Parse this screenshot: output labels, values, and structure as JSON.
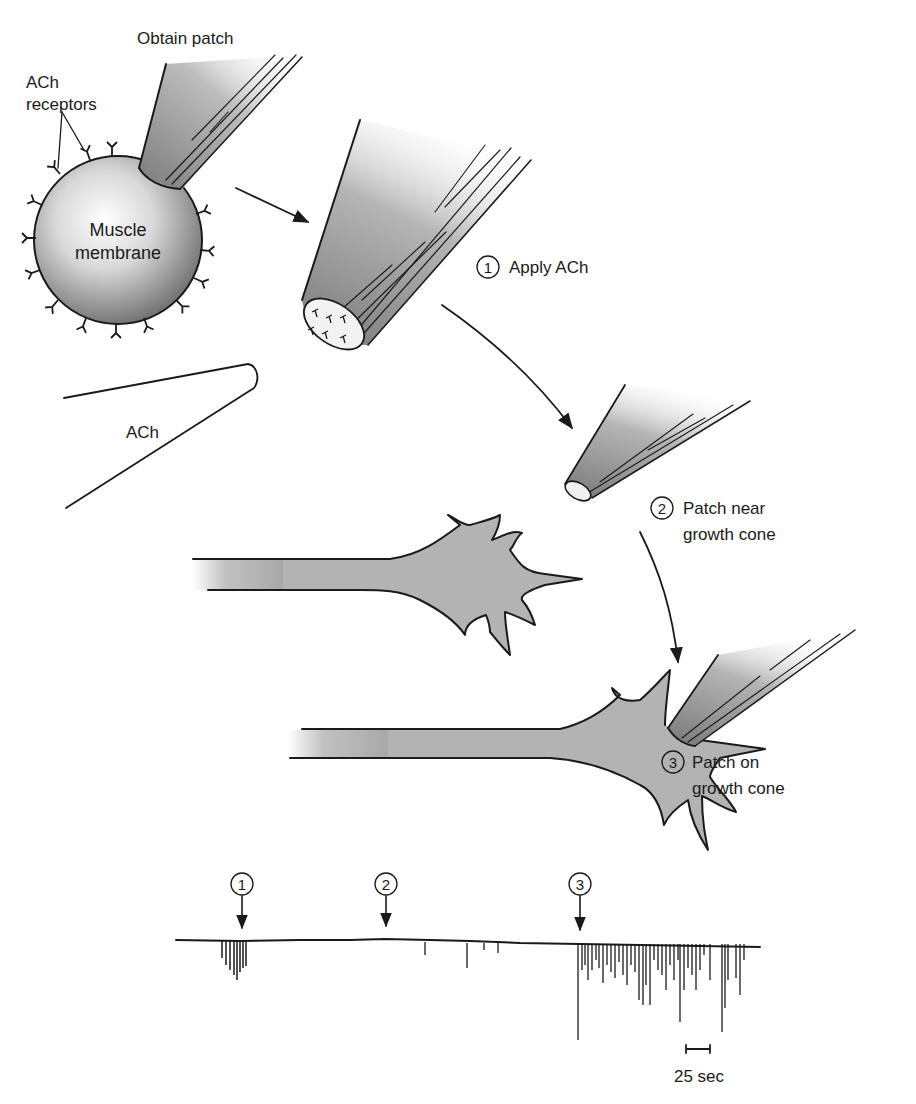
{
  "figure": {
    "labels": {
      "obtain_patch": "Obtain patch",
      "ach_receptors_line1": "ACh",
      "ach_receptors_line2": "receptors",
      "muscle_line1": "Muscle",
      "muscle_line2": "membrane",
      "ach_pipette": "ACh",
      "step1_num": "1",
      "step1_text": "Apply ACh",
      "step2_num": "2",
      "step2_line1": "Patch near",
      "step2_line2": "growth cone",
      "step3_num": "3",
      "step3_line1": "Patch on",
      "step3_line2": "growth cone"
    },
    "trace": {
      "markers": [
        {
          "num": "1",
          "x": 242
        },
        {
          "num": "2",
          "x": 384
        },
        {
          "num": "3",
          "x": 580
        }
      ],
      "scale_bar_label": "25 sec"
    }
  },
  "colors": {
    "ink": "#1a1a1a",
    "shade": "#9a9a9a",
    "light": "#e8e8e8"
  }
}
